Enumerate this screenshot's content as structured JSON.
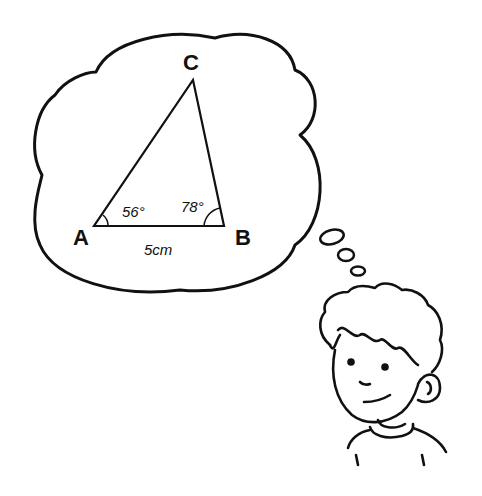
{
  "illustration": {
    "description": "Boy thinking about a triangle in a thought bubble",
    "triangle": {
      "vertices": {
        "A": "A",
        "B": "B",
        "C": "C"
      },
      "angle_A": "56°",
      "angle_B": "78°",
      "side_AB": "5cm"
    },
    "colors": {
      "ink": "#111111",
      "background": "#ffffff"
    }
  }
}
